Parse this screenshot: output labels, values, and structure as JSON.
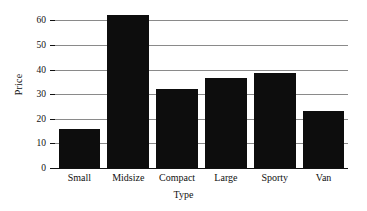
{
  "chart_data": {
    "type": "bar",
    "title": "",
    "xlabel": "Type",
    "ylabel": "Price",
    "categories": [
      "Small",
      "Midsize",
      "Compact",
      "Large",
      "Sporty",
      "Van"
    ],
    "values": [
      16,
      62,
      32,
      36.5,
      38.5,
      23
    ],
    "ylim": [
      0,
      65
    ],
    "yticks": [
      0,
      10,
      20,
      30,
      40,
      50,
      60
    ],
    "ytick_labels": [
      "0",
      "10",
      "20",
      "30",
      "40",
      "50",
      "60"
    ],
    "grid": true,
    "grid_axis": "y",
    "legend": null,
    "bar_color": "#0d0d0d",
    "grid_color": "#8a8a8a",
    "background_color": "#ffffff"
  }
}
